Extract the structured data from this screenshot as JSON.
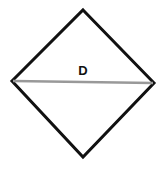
{
  "diagram": {
    "shape": "square rotated 45° (rhombus) with horizontal diagonal",
    "label": "D",
    "colors": {
      "outline": "#111111",
      "diagonal": "#999999",
      "background": "#ffffff"
    },
    "vertices": {
      "top": [
        83,
        10
      ],
      "right": [
        154,
        83
      ],
      "bottom": [
        83,
        157
      ],
      "left": [
        12,
        81
      ]
    }
  }
}
